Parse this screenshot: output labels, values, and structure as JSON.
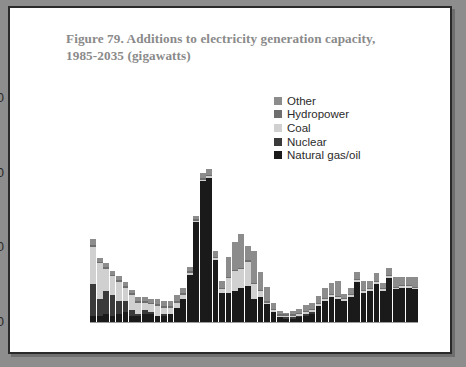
{
  "figure": {
    "title_line1": "Figure 79. Additions to electricity generation capacity,",
    "title_line2": "1985-2035 (gigawatts)",
    "frame_color": "#2a2a2a",
    "background": "#ffffff",
    "page_background": "#8d8d8d"
  },
  "legend": {
    "position": "inside-top-right",
    "items": [
      {
        "label": "Other",
        "color": "#8c8c8c"
      },
      {
        "label": "Hydropower",
        "color": "#6e6e6e"
      },
      {
        "label": "Coal",
        "color": "#d0d0d0"
      },
      {
        "label": "Nuclear",
        "color": "#3a3a3a"
      },
      {
        "label": "Natural gas/oil",
        "color": "#1a1a1a"
      }
    ]
  },
  "chart_data": {
    "type": "bar",
    "stacked": true,
    "title": "Figure 79. Additions to electricity generation capacity, 1985-2035 (gigawatts)",
    "xlabel": "",
    "ylabel": "gigawatts",
    "ylim": [
      0,
      62
    ],
    "yticks": [
      0,
      20,
      40,
      60
    ],
    "ytick_labels": [
      "0",
      "20",
      "40",
      "60"
    ],
    "xticks": [
      1985,
      1995,
      2005,
      2015,
      2025,
      2035
    ],
    "xtick_labels": [
      "1985",
      "1995",
      "2005",
      "2015",
      "2025",
      "2035"
    ],
    "grid": false,
    "categories": [
      1985,
      1986,
      1987,
      1988,
      1989,
      1990,
      1991,
      1992,
      1993,
      1994,
      1995,
      1996,
      1997,
      1998,
      1999,
      2000,
      2001,
      2002,
      2003,
      2004,
      2005,
      2006,
      2007,
      2008,
      2009,
      2010,
      2011,
      2012,
      2013,
      2014,
      2015,
      2016,
      2017,
      2018,
      2019,
      2020,
      2021,
      2022,
      2023,
      2024,
      2025,
      2026,
      2027,
      2028,
      2029,
      2030,
      2031,
      2032,
      2033,
      2034,
      2035
    ],
    "series": [
      {
        "name": "Natural gas/oil",
        "color": "#1a1a1a",
        "values": [
          2.0,
          2.0,
          2.5,
          2.0,
          2.5,
          3.0,
          2.0,
          2.0,
          2.5,
          2.5,
          2.0,
          2.0,
          2.5,
          4.0,
          6.5,
          13.0,
          27.0,
          38.0,
          39.0,
          17.0,
          8.0,
          8.0,
          8.5,
          9.5,
          10.0,
          6.5,
          7.0,
          5.0,
          3.0,
          1.5,
          1.0,
          1.0,
          1.5,
          2.0,
          2.5,
          4.5,
          6.0,
          7.0,
          6.5,
          6.0,
          7.0,
          11.0,
          8.0,
          8.5,
          10.5,
          8.5,
          12.0,
          9.0,
          9.5,
          9.5,
          9.0
        ]
      },
      {
        "name": "Nuclear",
        "color": "#3a3a3a",
        "values": [
          8.5,
          4.5,
          6.0,
          5.5,
          3.5,
          3.0,
          1.5,
          0.5,
          1.0,
          0.5,
          0.0,
          0.5,
          0.0,
          0.0,
          0.0,
          0.0,
          0.0,
          0.0,
          0.0,
          0.0,
          0.0,
          0.0,
          0.0,
          0.0,
          0.0,
          0.0,
          0.0,
          0.0,
          0.0,
          0.0,
          0.5,
          0.5,
          0.5,
          0.5,
          0.5,
          0.0,
          0.0,
          0.0,
          0.0,
          0.0,
          0.0,
          0.0,
          0.0,
          0.0,
          0.0,
          0.0,
          0.0,
          0.0,
          0.0,
          0.0,
          0.0
        ]
      },
      {
        "name": "Coal",
        "color": "#d0d0d0",
        "values": [
          10.0,
          9.5,
          6.0,
          5.0,
          5.0,
          3.5,
          4.0,
          3.0,
          2.0,
          2.0,
          2.5,
          1.5,
          1.5,
          1.5,
          1.0,
          0.5,
          0.5,
          0.5,
          0.5,
          0.5,
          1.0,
          4.0,
          5.5,
          5.0,
          6.5,
          4.0,
          1.5,
          0.5,
          0.5,
          0.5,
          0.5,
          0.5,
          0.5,
          0.5,
          0.5,
          0.5,
          0.5,
          0.5,
          0.5,
          0.5,
          0.5,
          0.5,
          0.5,
          0.5,
          0.5,
          0.5,
          0.5,
          0.5,
          0.5,
          0.5,
          0.5
        ]
      },
      {
        "name": "Hydropower",
        "color": "#6e6e6e",
        "values": [
          0.5,
          0.5,
          0.5,
          0.5,
          0.5,
          0.5,
          0.5,
          0.5,
          0.5,
          0.5,
          0.5,
          0.5,
          0.5,
          0.5,
          0.5,
          0.5,
          0.3,
          0.3,
          0.3,
          0.3,
          0.3,
          0.3,
          0.3,
          0.3,
          0.3,
          0.3,
          0.3,
          0.3,
          0.3,
          0.3,
          0.3,
          0.3,
          0.3,
          0.3,
          0.3,
          0.3,
          0.3,
          0.3,
          0.3,
          0.3,
          0.3,
          0.3,
          0.3,
          0.3,
          0.3,
          0.3,
          0.3,
          0.3,
          0.3,
          0.3,
          0.3
        ]
      },
      {
        "name": "Other",
        "color": "#8c8c8c",
        "values": [
          1.5,
          1.0,
          1.0,
          1.0,
          1.0,
          1.0,
          1.0,
          1.0,
          1.0,
          1.0,
          1.5,
          1.5,
          1.5,
          1.5,
          1.5,
          1.0,
          1.0,
          1.5,
          1.5,
          1.5,
          2.0,
          5.5,
          7.5,
          9.0,
          4.0,
          8.5,
          5.0,
          4.0,
          1.5,
          1.0,
          0.5,
          1.0,
          1.0,
          1.5,
          1.5,
          2.0,
          2.5,
          3.0,
          4.0,
          1.0,
          1.5,
          2.0,
          2.5,
          2.0,
          2.0,
          1.5,
          2.0,
          2.5,
          2.0,
          2.0,
          2.5
        ]
      }
    ]
  }
}
